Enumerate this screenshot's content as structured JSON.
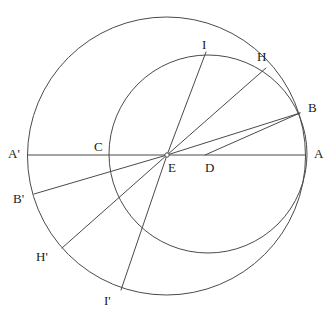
{
  "figure": {
    "kind": "geometric-construction-diagram",
    "background_color": "#ffffff",
    "stroke_color": "#4a4a4a",
    "label_color": "#1a1a1a",
    "width": 332,
    "height": 328
  },
  "circles": [
    {
      "name": "outer-circle",
      "center": {
        "x": 166.5,
        "y": 156.0
      },
      "radius": 139.0
    },
    {
      "name": "inner-circle",
      "center": {
        "x": 208.0,
        "y": 154.0
      },
      "radius": 99.0
    }
  ],
  "points": {
    "A": {
      "x": 305.5,
      "y": 155.0
    },
    "Ap": {
      "x": 28.0,
      "y": 155.0
    },
    "B": {
      "x": 300.0,
      "y": 113.0
    },
    "Bp": {
      "x": 34.0,
      "y": 194.0
    },
    "C": {
      "x": 110.0,
      "y": 155.0
    },
    "D": {
      "x": 205.0,
      "y": 155.0
    },
    "E": {
      "x": 167.0,
      "y": 155.0
    },
    "H": {
      "x": 266.0,
      "y": 68.0
    },
    "Hp": {
      "x": 62.0,
      "y": 248.0
    },
    "I": {
      "x": 206.0,
      "y": 52.0
    },
    "Ip": {
      "x": 121.0,
      "y": 290.0
    }
  },
  "segments": [
    {
      "name": "diameter-A-prime-to-A",
      "from": "Ap",
      "to": "A"
    },
    {
      "name": "radius-E-to-I",
      "from": "E",
      "to": "I"
    },
    {
      "name": "radius-E-to-H",
      "from": "E",
      "to": "H"
    },
    {
      "name": "radius-E-to-B",
      "from": "E",
      "to": "B"
    },
    {
      "name": "chord-D-to-B",
      "from": "D",
      "to": "B"
    },
    {
      "name": "radius-E-to-B-prime",
      "from": "E",
      "to": "Bp"
    },
    {
      "name": "radius-E-to-H-prime",
      "from": "E",
      "to": "Hp"
    },
    {
      "name": "radius-E-to-I-prime",
      "from": "E",
      "to": "Ip"
    }
  ],
  "labels": [
    {
      "name": "label-I",
      "text": "I",
      "x": 202,
      "y": 38
    },
    {
      "name": "label-H",
      "text": "H",
      "x": 257,
      "y": 50
    },
    {
      "name": "label-B",
      "text": "B",
      "x": 308,
      "y": 101
    },
    {
      "name": "label-A",
      "text": "A",
      "x": 314,
      "y": 147
    },
    {
      "name": "label-A-prime",
      "text": "A'",
      "x": 8,
      "y": 147
    },
    {
      "name": "label-C",
      "text": "C",
      "x": 94,
      "y": 140
    },
    {
      "name": "label-E",
      "text": "E",
      "x": 168,
      "y": 161
    },
    {
      "name": "label-D",
      "text": "D",
      "x": 205,
      "y": 161
    },
    {
      "name": "label-B-prime",
      "text": "B'",
      "x": 13,
      "y": 192
    },
    {
      "name": "label-H-prime",
      "text": "H'",
      "x": 36,
      "y": 250
    },
    {
      "name": "label-I-prime",
      "text": "I'",
      "x": 104,
      "y": 294
    }
  ]
}
